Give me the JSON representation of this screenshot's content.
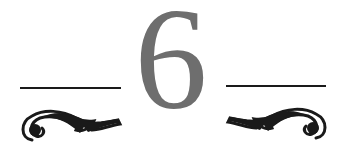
{
  "heading": {
    "numeral": "6",
    "numeral_color": "#6e6e6e",
    "ornament_color": "#1a1a1a",
    "ornaments": [
      "left-rule",
      "left-scroll-flourish-icon",
      "right-rule",
      "right-scroll-flourish-icon"
    ]
  }
}
